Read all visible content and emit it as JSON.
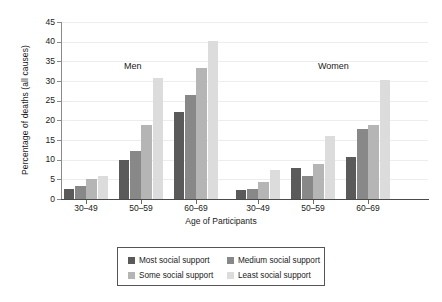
{
  "chart_data": {
    "type": "bar",
    "title": "",
    "xlabel": "Age of Participants",
    "ylabel": "Percentage of deaths (all causes)",
    "ylim": [
      0,
      45
    ],
    "ytick_labels": [
      "0",
      "5",
      "10",
      "15",
      "20",
      "25",
      "30",
      "35",
      "40",
      "45"
    ],
    "ytick_values": [
      0,
      5,
      10,
      15,
      20,
      25,
      30,
      35,
      40,
      45
    ],
    "grid": true,
    "legend_position": "bottom-center",
    "panel_labels": [
      "Men",
      "Women"
    ],
    "categories": [
      "30–49",
      "50–59",
      "60–69",
      "30–49",
      "50–59",
      "60–69"
    ],
    "group_labels": [
      "Men 30–49",
      "Men 50–59",
      "Men 60–69",
      "Women 30–49",
      "Women 50–59",
      "Women 60–69"
    ],
    "series": [
      {
        "name": "Most social support",
        "color": "#5a5a5a",
        "values": [
          2.5,
          10.0,
          22.2,
          2.2,
          8.0,
          10.7
        ]
      },
      {
        "name": "Medium social support",
        "color": "#888888",
        "values": [
          3.2,
          12.3,
          26.5,
          2.5,
          5.8,
          17.7
        ]
      },
      {
        "name": "Some social support",
        "color": "#b5b5b5",
        "values": [
          5.2,
          18.7,
          33.2,
          4.2,
          8.8,
          18.8
        ]
      },
      {
        "name": "Least social support",
        "color": "#dcdcdc",
        "values": [
          5.8,
          30.8,
          40.3,
          7.3,
          16.0,
          30.2
        ]
      }
    ]
  },
  "legend": {
    "entries": [
      {
        "label": "Most social support",
        "color": "#5a5a5a"
      },
      {
        "label": "Medium social support",
        "color": "#888888"
      },
      {
        "label": "Some social support",
        "color": "#b5b5b5"
      },
      {
        "label": "Least social support",
        "color": "#dcdcdc"
      }
    ]
  },
  "colors": {
    "axis": "#4a4a4a",
    "grid": "#ededed",
    "text": "#1a1a1a",
    "background": "#ffffff"
  }
}
